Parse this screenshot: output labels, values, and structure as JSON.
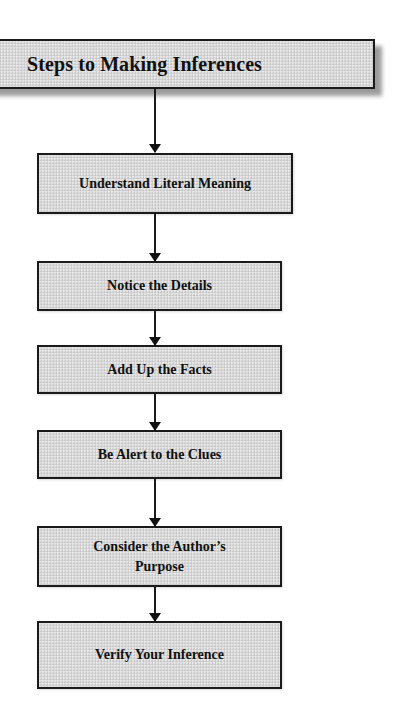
{
  "diagram": {
    "title": "Steps to Making Inferences",
    "type": "vertical-flowchart",
    "colors": {
      "box_fill": "#d8d8d8",
      "border": "#1a1a1a",
      "text": "#111111",
      "shadow": "#8a8a8a",
      "background": "#ffffff"
    },
    "steps": [
      {
        "label": "Understand Literal Meaning"
      },
      {
        "label": "Notice the Details"
      },
      {
        "label": "Add Up the Facts"
      },
      {
        "label": "Be Alert to the Clues"
      },
      {
        "label": "Consider the Author’s Purpose"
      },
      {
        "label": "Verify Your Inference"
      }
    ],
    "connections": [
      {
        "from": "title",
        "to": "Understand Literal Meaning"
      },
      {
        "from": "Understand Literal Meaning",
        "to": "Notice the Details"
      },
      {
        "from": "Notice the Details",
        "to": "Add Up the Facts"
      },
      {
        "from": "Add Up the Facts",
        "to": "Be Alert to the Clues"
      },
      {
        "from": "Be Alert to the Clues",
        "to": "Consider the Author’s Purpose"
      },
      {
        "from": "Consider the Author’s Purpose",
        "to": "Verify Your Inference"
      }
    ]
  }
}
